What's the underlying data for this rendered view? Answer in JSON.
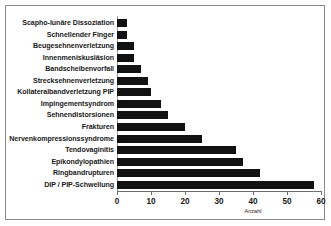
{
  "chart_data": {
    "type": "bar",
    "orientation": "horizontal",
    "title": "",
    "xlabel": "Anzahl",
    "ylabel": "",
    "xlim": [
      0,
      60
    ],
    "xticks": [
      0,
      10,
      20,
      30,
      40,
      50,
      60
    ],
    "grid": false,
    "legend": false,
    "bar_color": "#121212",
    "categories": [
      "Scapho-lunäre Dissoziation",
      "Schnellender Finger",
      "Beugesehnenverletzung",
      "Innenmeniskusläsion",
      "Bandscheibenvorfall",
      "Strecksehnenverletzung",
      "Kollateralbandverletzung PIP",
      "Impingementsyndrom",
      "Sehnendistorsionen",
      "Frakturen",
      "Nervenkompressionssyndrome",
      "Tendovaginitis",
      "Epikondylopathien",
      "Ringbandrupturen",
      "DIP / PIP-Schwellung"
    ],
    "values": [
      3,
      3,
      5,
      5,
      7,
      9,
      10,
      13,
      15,
      20,
      25,
      35,
      37,
      42,
      58
    ]
  }
}
